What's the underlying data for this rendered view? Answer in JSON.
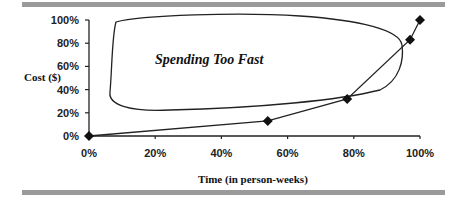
{
  "chart_data": {
    "type": "line",
    "title": "",
    "xlabel": "Time (in person-weeks)",
    "ylabel": "Cost ($)",
    "x_ticks": [
      "0%",
      "20%",
      "40%",
      "60%",
      "80%",
      "100%"
    ],
    "y_ticks": [
      "0%",
      "20%",
      "40%",
      "60%",
      "80%",
      "100%"
    ],
    "xlim": [
      0,
      100
    ],
    "ylim": [
      0,
      100
    ],
    "grid": false,
    "legend": null,
    "series": [
      {
        "name": "Actual cost",
        "marker": "diamond",
        "x": [
          0,
          54,
          78,
          97,
          100
        ],
        "y": [
          0,
          13,
          32,
          83,
          100
        ]
      }
    ],
    "annotations": [
      {
        "text": "Spending Too Fast",
        "type": "region-outline",
        "region": "upper-left (over-budget zone)"
      }
    ]
  },
  "labels": {
    "annotation": "Spending Too Fast",
    "xlabel": "Time (in person-weeks)",
    "ylabel": "Cost ($)"
  },
  "colors": {
    "rule": "#9a9a9a",
    "line": "#222222",
    "marker": "#111111"
  }
}
